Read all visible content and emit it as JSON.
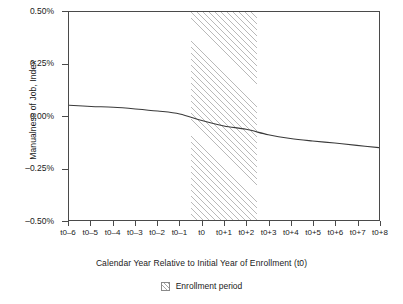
{
  "chart_data": {
    "type": "line",
    "title": "",
    "xlabel": "Calendar Year Relative to Initial Year of Enrollment (t0)",
    "ylabel": "Manualness of Job, Index",
    "x": [
      "t0–6",
      "t0–5",
      "t0–4",
      "t0–3",
      "t0–2",
      "t0–1",
      "t0",
      "t0+1",
      "t0+2",
      "t0+3",
      "t0+4",
      "t0+5",
      "t0+6",
      "t0+7",
      "t0+8"
    ],
    "values": [
      0.052,
      0.046,
      0.042,
      0.034,
      0.024,
      0.01,
      -0.022,
      -0.048,
      -0.064,
      -0.09,
      -0.108,
      -0.12,
      -0.13,
      -0.141,
      -0.152
    ],
    "ylim": [
      -0.5,
      0.5
    ],
    "ytick_values": [
      0.5,
      0.25,
      0.0,
      -0.25,
      -0.5
    ],
    "ytick_labels": [
      "0.50%",
      "0.25%",
      "0.00%",
      "–0.25%",
      "–0.50%"
    ],
    "grid": false,
    "legend_position": "bottom-center",
    "series": [
      {
        "name": "Manualness of Job, Index",
        "values": [
          0.052,
          0.046,
          0.042,
          0.034,
          0.024,
          0.01,
          -0.022,
          -0.048,
          -0.064,
          -0.09,
          -0.108,
          -0.12,
          -0.13,
          -0.141,
          -0.152
        ]
      }
    ],
    "shaded_region": {
      "label": "Enrollment period",
      "x_start": "t0–0.5",
      "x_end": "t0+2.5",
      "style": "diagonal-hatch"
    },
    "line_color": "#3a3a3a",
    "axis_color": "#4a4a4a",
    "hatch_color": "#b9b9b9"
  },
  "axis": {
    "y_title": "Manualness of Job, Index",
    "x_title": "Calendar Year Relative to Initial Year of Enrollment (t0)",
    "y_ticks": [
      "0.50%",
      "0.25%",
      "0.00%",
      "–0.25%",
      "–0.50%"
    ],
    "x_ticks": [
      "t0–6",
      "t0–5",
      "t0–4",
      "t0–3",
      "t0–2",
      "t0–1",
      "t0",
      "t0+1",
      "t0+2",
      "t0+3",
      "t0+4",
      "t0+5",
      "t0+6",
      "t0+7",
      "t0+8"
    ]
  },
  "legend": {
    "items": [
      {
        "label": "Enrollment period",
        "swatch": "hatched-square-icon"
      }
    ]
  }
}
